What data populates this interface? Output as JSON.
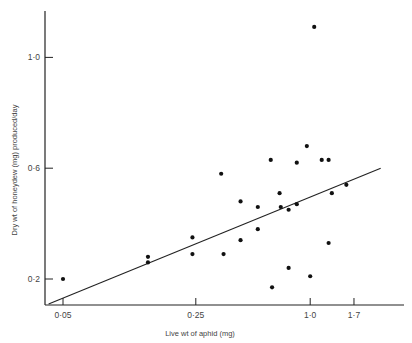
{
  "chart_data": {
    "type": "scatter",
    "title": "",
    "xlabel": "Live wt of aphid (mg)",
    "ylabel": "Dry wt of honeydew (mg) produced/day",
    "x_scale": "log",
    "x_ticks": [
      0.05,
      0.25,
      1.0,
      1.7
    ],
    "x_tick_labels": [
      "0·05",
      "0·25",
      "1·0",
      "1·7"
    ],
    "y_ticks": [
      0.2,
      0.6,
      1.0
    ],
    "y_tick_labels": [
      "0·2",
      "0·6",
      "1·0"
    ],
    "xlim": [
      0.042,
      3.2
    ],
    "ylim": [
      0.11,
      1.17
    ],
    "grid": false,
    "legend": null,
    "series": [
      {
        "name": "observations",
        "points": [
          {
            "x": 0.05,
            "y": 0.2
          },
          {
            "x": 0.14,
            "y": 0.28
          },
          {
            "x": 0.14,
            "y": 0.26
          },
          {
            "x": 0.24,
            "y": 0.35
          },
          {
            "x": 0.24,
            "y": 0.29
          },
          {
            "x": 0.34,
            "y": 0.58
          },
          {
            "x": 0.35,
            "y": 0.29
          },
          {
            "x": 0.43,
            "y": 0.48
          },
          {
            "x": 0.43,
            "y": 0.34
          },
          {
            "x": 0.53,
            "y": 0.46
          },
          {
            "x": 0.53,
            "y": 0.38
          },
          {
            "x": 0.62,
            "y": 0.63
          },
          {
            "x": 0.63,
            "y": 0.17
          },
          {
            "x": 0.69,
            "y": 0.51
          },
          {
            "x": 0.7,
            "y": 0.46
          },
          {
            "x": 0.77,
            "y": 0.45
          },
          {
            "x": 0.77,
            "y": 0.24
          },
          {
            "x": 0.85,
            "y": 0.62
          },
          {
            "x": 0.85,
            "y": 0.47
          },
          {
            "x": 0.96,
            "y": 0.68
          },
          {
            "x": 1.0,
            "y": 0.21
          },
          {
            "x": 1.05,
            "y": 1.11
          },
          {
            "x": 1.15,
            "y": 0.63
          },
          {
            "x": 1.25,
            "y": 0.63
          },
          {
            "x": 1.25,
            "y": 0.33
          },
          {
            "x": 1.3,
            "y": 0.51
          },
          {
            "x": 1.55,
            "y": 0.54
          }
        ]
      },
      {
        "name": "regression line",
        "type": "line",
        "points": [
          {
            "x": 0.042,
            "y": 0.11
          },
          {
            "x": 2.35,
            "y": 0.6
          }
        ]
      }
    ]
  },
  "axes": {
    "x_title": "Live wt of aphid (mg)",
    "y_title": "Dry wt of honeydew (mg) produced/day"
  }
}
